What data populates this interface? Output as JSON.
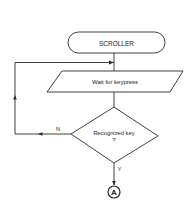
{
  "diagram": {
    "type": "flowchart",
    "nodes": {
      "start": {
        "shape": "terminator",
        "label": "SCROLLER"
      },
      "input": {
        "shape": "parallelogram",
        "label": "Wait for keypress"
      },
      "decision": {
        "shape": "diamond",
        "label_line1": "Recognized key",
        "label_line2": "?"
      },
      "connector": {
        "shape": "circle",
        "label": "A"
      }
    },
    "edges": [
      {
        "from": "start",
        "to": "input",
        "label": ""
      },
      {
        "from": "input",
        "to": "decision",
        "label": ""
      },
      {
        "from": "decision",
        "to": "input",
        "label": "N"
      },
      {
        "from": "decision",
        "to": "connector",
        "label": "Y"
      }
    ],
    "colors": {
      "line": "#2a2a2a",
      "background": "#ffffff"
    }
  }
}
